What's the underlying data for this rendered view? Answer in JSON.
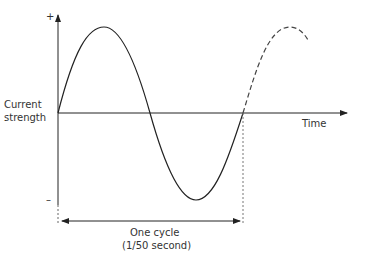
{
  "diagram": {
    "y_axis": {
      "label_line1": "Current",
      "label_line2": "strength",
      "plus": "+",
      "minus": "–"
    },
    "x_axis": {
      "label": "Time"
    },
    "cycle": {
      "label": "One cycle",
      "sublabel": "(1/50 second)"
    },
    "colors": {
      "line": "#222222",
      "dashed": "#555555"
    }
  }
}
